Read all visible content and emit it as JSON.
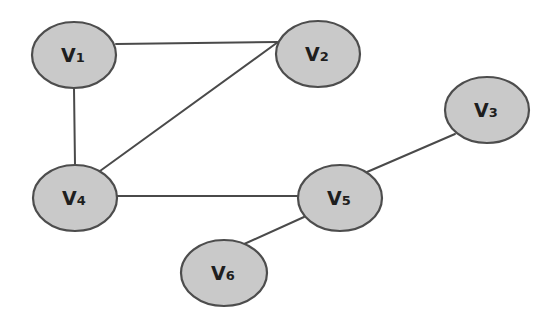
{
  "diagram": {
    "type": "undirected-graph",
    "style": {
      "node_fill": "#c9c9c9",
      "node_stroke": "#4d4d4d",
      "edge_color": "#4a4a4a",
      "background": "#ffffff"
    },
    "nodes": [
      {
        "id": "v1",
        "letter": "V",
        "index": "1",
        "cx": 74,
        "cy": 55,
        "rx": 42,
        "ry": 33
      },
      {
        "id": "v2",
        "letter": "V",
        "index": "2",
        "cx": 318,
        "cy": 54,
        "rx": 42,
        "ry": 33
      },
      {
        "id": "v3",
        "letter": "V",
        "index": "3",
        "cx": 487,
        "cy": 110,
        "rx": 42,
        "ry": 33
      },
      {
        "id": "v4",
        "letter": "V",
        "index": "4",
        "cx": 75,
        "cy": 198,
        "rx": 42,
        "ry": 33
      },
      {
        "id": "v5",
        "letter": "V",
        "index": "5",
        "cx": 340,
        "cy": 198,
        "rx": 42,
        "ry": 33
      },
      {
        "id": "v6",
        "letter": "V",
        "index": "6",
        "cx": 224,
        "cy": 273,
        "rx": 43,
        "ry": 33
      }
    ],
    "edges": [
      {
        "from": "v1",
        "to": "v2",
        "x1": 116,
        "y1": 44,
        "x2": 277,
        "y2": 42
      },
      {
        "from": "v1",
        "to": "v4",
        "x1": 74,
        "y1": 88,
        "x2": 75,
        "y2": 165
      },
      {
        "from": "v4",
        "to": "v2",
        "x1": 100,
        "y1": 171,
        "x2": 278,
        "y2": 42
      },
      {
        "from": "v4",
        "to": "v5",
        "x1": 117,
        "y1": 196,
        "x2": 298,
        "y2": 196
      },
      {
        "from": "v5",
        "to": "v3",
        "x1": 367,
        "y1": 172,
        "x2": 455,
        "y2": 134
      },
      {
        "from": "v5",
        "to": "v6",
        "x1": 304,
        "y1": 217,
        "x2": 242,
        "y2": 245
      }
    ]
  }
}
